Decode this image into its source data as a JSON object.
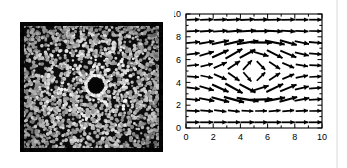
{
  "figure": {
    "panels": [
      {
        "id": "micrograph",
        "kind": "grayscale-micrograph",
        "description": "dense disordered monolayer of bright particles on dark background with a dark circular inclusion at the centre ringed by a bright shell of particles",
        "background_color": "#0d0d0d",
        "particle_color": "#c9c9c9",
        "inclusion": {
          "center_x_frac": 0.53,
          "center_y_frac": 0.49,
          "core_radius_px": 7,
          "ring_outer_radius_px": 11,
          "core_color": "#050505",
          "ring_color": "#e6e6e6"
        },
        "particle_count": 2300,
        "particle_radius_px": 1.5
      }
    ]
  },
  "chart_data": {
    "type": "scatter",
    "subtype": "quiver",
    "title": "",
    "xlabel": "",
    "ylabel": "",
    "xlim": [
      0,
      10
    ],
    "ylim": [
      0,
      10
    ],
    "xticks": [
      0,
      2,
      4,
      6,
      8,
      10
    ],
    "yticks": [
      0,
      2,
      4,
      6,
      8,
      10
    ],
    "xtick_labels": [
      "0",
      "2",
      "4",
      "6",
      "8",
      "10"
    ],
    "ytick_labels": [
      "0",
      "2",
      "4",
      "6",
      "8",
      "10"
    ],
    "minor_tick_step": 1,
    "grid": false,
    "legend": null,
    "frame": true,
    "arrow_scale": 1.0,
    "grid_x": [
      0.5,
      1.5,
      2.5,
      3.5,
      4.5,
      5.5,
      6.5,
      7.5,
      8.5,
      9.5
    ],
    "grid_y": [
      0.5,
      1.5,
      2.5,
      3.5,
      4.5,
      5.5,
      6.5,
      7.5,
      8.5,
      9.5
    ],
    "vectors": [
      {
        "x": 0.5,
        "y": 9.5,
        "u": 0.62,
        "v": 0.02
      },
      {
        "x": 1.5,
        "y": 9.5,
        "u": 0.62,
        "v": 0.02
      },
      {
        "x": 2.5,
        "y": 9.5,
        "u": 0.64,
        "v": 0.02
      },
      {
        "x": 3.5,
        "y": 9.5,
        "u": 0.66,
        "v": 0.03
      },
      {
        "x": 4.5,
        "y": 9.5,
        "u": 0.68,
        "v": 0.03
      },
      {
        "x": 5.5,
        "y": 9.5,
        "u": 0.68,
        "v": 0.02
      },
      {
        "x": 6.5,
        "y": 9.5,
        "u": 0.66,
        "v": 0.01
      },
      {
        "x": 7.5,
        "y": 9.5,
        "u": 0.64,
        "v": 0.01
      },
      {
        "x": 8.5,
        "y": 9.5,
        "u": 0.62,
        "v": 0.0
      },
      {
        "x": 9.5,
        "y": 9.5,
        "u": 0.6,
        "v": 0.0
      },
      {
        "x": 0.5,
        "y": 8.5,
        "u": 0.62,
        "v": 0.03
      },
      {
        "x": 1.5,
        "y": 8.5,
        "u": 0.64,
        "v": 0.04
      },
      {
        "x": 2.5,
        "y": 8.5,
        "u": 0.68,
        "v": 0.05
      },
      {
        "x": 3.5,
        "y": 8.5,
        "u": 0.74,
        "v": 0.06
      },
      {
        "x": 4.5,
        "y": 8.5,
        "u": 0.8,
        "v": 0.05
      },
      {
        "x": 5.5,
        "y": 8.5,
        "u": 0.8,
        "v": 0.01
      },
      {
        "x": 6.5,
        "y": 8.5,
        "u": 0.74,
        "v": -0.03
      },
      {
        "x": 7.5,
        "y": 8.5,
        "u": 0.68,
        "v": -0.04
      },
      {
        "x": 8.5,
        "y": 8.5,
        "u": 0.62,
        "v": -0.03
      },
      {
        "x": 9.5,
        "y": 8.5,
        "u": 0.6,
        "v": -0.01
      },
      {
        "x": 0.5,
        "y": 7.5,
        "u": 0.66,
        "v": 0.06
      },
      {
        "x": 1.5,
        "y": 7.5,
        "u": 0.72,
        "v": 0.12
      },
      {
        "x": 2.5,
        "y": 7.5,
        "u": 0.82,
        "v": 0.18
      },
      {
        "x": 3.5,
        "y": 7.5,
        "u": 0.94,
        "v": 0.22
      },
      {
        "x": 4.5,
        "y": 7.5,
        "u": 1.02,
        "v": 0.16
      },
      {
        "x": 5.5,
        "y": 7.5,
        "u": 1.02,
        "v": -0.02
      },
      {
        "x": 6.5,
        "y": 7.5,
        "u": 0.94,
        "v": -0.18
      },
      {
        "x": 7.5,
        "y": 7.5,
        "u": 0.8,
        "v": -0.22
      },
      {
        "x": 8.5,
        "y": 7.5,
        "u": 0.68,
        "v": -0.14
      },
      {
        "x": 9.5,
        "y": 7.5,
        "u": 0.62,
        "v": -0.05
      },
      {
        "x": 0.5,
        "y": 6.5,
        "u": 0.62,
        "v": 0.08
      },
      {
        "x": 1.5,
        "y": 6.5,
        "u": 0.68,
        "v": 0.2
      },
      {
        "x": 2.5,
        "y": 6.5,
        "u": 0.78,
        "v": 0.36
      },
      {
        "x": 3.5,
        "y": 6.5,
        "u": 0.8,
        "v": 0.46
      },
      {
        "x": 4.5,
        "y": 6.5,
        "u": 0.74,
        "v": 0.4
      },
      {
        "x": 5.5,
        "y": 6.5,
        "u": 0.7,
        "v": -0.2
      },
      {
        "x": 6.5,
        "y": 6.5,
        "u": 0.74,
        "v": -0.38
      },
      {
        "x": 7.5,
        "y": 6.5,
        "u": 0.76,
        "v": -0.32
      },
      {
        "x": 8.5,
        "y": 6.5,
        "u": 0.66,
        "v": -0.16
      },
      {
        "x": 9.5,
        "y": 6.5,
        "u": 0.6,
        "v": -0.05
      },
      {
        "x": 0.5,
        "y": 5.5,
        "u": 0.56,
        "v": 0.05
      },
      {
        "x": 1.5,
        "y": 5.5,
        "u": 0.58,
        "v": 0.14
      },
      {
        "x": 2.5,
        "y": 5.5,
        "u": 0.62,
        "v": 0.28
      },
      {
        "x": 3.5,
        "y": 5.5,
        "u": 0.58,
        "v": 0.4
      },
      {
        "x": 4.5,
        "y": 5.5,
        "u": 0.42,
        "v": 0.46
      },
      {
        "x": 5.5,
        "y": 5.5,
        "u": 0.4,
        "v": -0.42
      },
      {
        "x": 6.5,
        "y": 5.5,
        "u": 0.52,
        "v": -0.34
      },
      {
        "x": 7.5,
        "y": 5.5,
        "u": 0.56,
        "v": -0.24
      },
      {
        "x": 8.5,
        "y": 5.5,
        "u": 0.58,
        "v": -0.1
      },
      {
        "x": 9.5,
        "y": 5.5,
        "u": 0.58,
        "v": -0.02
      },
      {
        "x": 0.5,
        "y": 4.5,
        "u": 0.56,
        "v": -0.04
      },
      {
        "x": 1.5,
        "y": 4.5,
        "u": 0.58,
        "v": -0.12
      },
      {
        "x": 2.5,
        "y": 4.5,
        "u": 0.6,
        "v": -0.26
      },
      {
        "x": 3.5,
        "y": 4.5,
        "u": 0.54,
        "v": -0.38
      },
      {
        "x": 4.5,
        "y": 4.5,
        "u": 0.38,
        "v": -0.44
      },
      {
        "x": 5.5,
        "y": 4.5,
        "u": 0.4,
        "v": 0.4
      },
      {
        "x": 6.5,
        "y": 4.5,
        "u": 0.52,
        "v": 0.34
      },
      {
        "x": 7.5,
        "y": 4.5,
        "u": 0.56,
        "v": 0.24
      },
      {
        "x": 8.5,
        "y": 4.5,
        "u": 0.58,
        "v": 0.12
      },
      {
        "x": 9.5,
        "y": 4.5,
        "u": 0.58,
        "v": 0.03
      },
      {
        "x": 0.5,
        "y": 3.5,
        "u": 0.62,
        "v": -0.08
      },
      {
        "x": 1.5,
        "y": 3.5,
        "u": 0.68,
        "v": -0.2
      },
      {
        "x": 2.5,
        "y": 3.5,
        "u": 0.78,
        "v": -0.36
      },
      {
        "x": 3.5,
        "y": 3.5,
        "u": 0.82,
        "v": -0.46
      },
      {
        "x": 4.5,
        "y": 3.5,
        "u": 0.76,
        "v": -0.4
      },
      {
        "x": 5.5,
        "y": 3.5,
        "u": 0.72,
        "v": 0.22
      },
      {
        "x": 6.5,
        "y": 3.5,
        "u": 0.8,
        "v": 0.38
      },
      {
        "x": 7.5,
        "y": 3.5,
        "u": 0.78,
        "v": 0.32
      },
      {
        "x": 8.5,
        "y": 3.5,
        "u": 0.66,
        "v": 0.16
      },
      {
        "x": 9.5,
        "y": 3.5,
        "u": 0.6,
        "v": 0.05
      },
      {
        "x": 0.5,
        "y": 2.5,
        "u": 0.66,
        "v": -0.06
      },
      {
        "x": 1.5,
        "y": 2.5,
        "u": 0.72,
        "v": -0.14
      },
      {
        "x": 2.5,
        "y": 2.5,
        "u": 0.84,
        "v": -0.22
      },
      {
        "x": 3.5,
        "y": 2.5,
        "u": 0.96,
        "v": -0.26
      },
      {
        "x": 4.5,
        "y": 2.5,
        "u": 1.04,
        "v": -0.16
      },
      {
        "x": 5.5,
        "y": 2.5,
        "u": 1.06,
        "v": 0.04
      },
      {
        "x": 6.5,
        "y": 2.5,
        "u": 0.98,
        "v": 0.18
      },
      {
        "x": 7.5,
        "y": 2.5,
        "u": 0.84,
        "v": 0.22
      },
      {
        "x": 8.5,
        "y": 2.5,
        "u": 0.7,
        "v": 0.14
      },
      {
        "x": 9.5,
        "y": 2.5,
        "u": 0.62,
        "v": 0.04
      },
      {
        "x": 0.5,
        "y": 1.5,
        "u": 0.62,
        "v": -0.02
      },
      {
        "x": 1.5,
        "y": 1.5,
        "u": 0.6,
        "v": -0.05
      },
      {
        "x": 2.5,
        "y": 1.5,
        "u": 0.58,
        "v": -0.07
      },
      {
        "x": 3.5,
        "y": 1.5,
        "u": 0.56,
        "v": -0.06
      },
      {
        "x": 4.5,
        "y": 1.5,
        "u": 0.56,
        "v": -0.03
      },
      {
        "x": 5.5,
        "y": 1.5,
        "u": 0.56,
        "v": 0.01
      },
      {
        "x": 6.5,
        "y": 1.5,
        "u": 0.56,
        "v": 0.04
      },
      {
        "x": 7.5,
        "y": 1.5,
        "u": 0.56,
        "v": 0.05
      },
      {
        "x": 8.5,
        "y": 1.5,
        "u": 0.58,
        "v": 0.03
      },
      {
        "x": 9.5,
        "y": 1.5,
        "u": 0.58,
        "v": 0.01
      },
      {
        "x": 0.5,
        "y": 0.5,
        "u": 0.62,
        "v": 0.0
      },
      {
        "x": 1.5,
        "y": 0.5,
        "u": 0.62,
        "v": 0.0
      },
      {
        "x": 2.5,
        "y": 0.5,
        "u": 0.62,
        "v": 0.0
      },
      {
        "x": 3.5,
        "y": 0.5,
        "u": 0.62,
        "v": 0.0
      },
      {
        "x": 4.5,
        "y": 0.5,
        "u": 0.64,
        "v": 0.0
      },
      {
        "x": 5.5,
        "y": 0.5,
        "u": 0.64,
        "v": 0.0
      },
      {
        "x": 6.5,
        "y": 0.5,
        "u": 0.64,
        "v": 0.0
      },
      {
        "x": 7.5,
        "y": 0.5,
        "u": 0.62,
        "v": 0.0
      },
      {
        "x": 8.5,
        "y": 0.5,
        "u": 0.62,
        "v": 0.0
      },
      {
        "x": 9.5,
        "y": 0.5,
        "u": 0.62,
        "v": 0.0
      }
    ]
  },
  "style": {
    "axis_color": "#000000",
    "arrow_color": "#000000",
    "page_background": "#ffffff",
    "edge_line_color": "#d8d8d8"
  }
}
